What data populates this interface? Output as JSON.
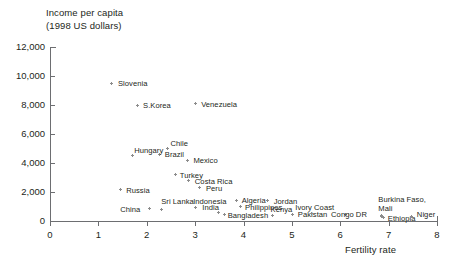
{
  "chart_data": {
    "type": "scatter",
    "title": "",
    "ylabel_line1": "Income per capita",
    "ylabel_line2": "(1998 US dollars)",
    "xlabel": "Fertility rate",
    "xlim": [
      0,
      8
    ],
    "ylim": [
      0,
      12000
    ],
    "xticks": [
      "0",
      "1",
      "2",
      "3",
      "4",
      "5",
      "6",
      "7",
      "8"
    ],
    "yticks": [
      "0",
      "2,000",
      "4,000",
      "6,000",
      "8,000",
      "10,000",
      "12,000"
    ],
    "grid": false,
    "legend": "none",
    "points": [
      {
        "label": "Slovenia",
        "x": 1.28,
        "y": 9500,
        "lx": 6,
        "ly": -4
      },
      {
        "label": "S.Korea",
        "x": 1.8,
        "y": 8000,
        "lx": 6,
        "ly": -4
      },
      {
        "label": "Venezuela",
        "x": 3.0,
        "y": 8100,
        "lx": 6,
        "ly": -4
      },
      {
        "label": "Chile",
        "x": 2.43,
        "y": 5000,
        "lx": 3,
        "ly": -10
      },
      {
        "label": "Brazil",
        "x": 2.27,
        "y": 4600,
        "lx": 5,
        "ly": -4
      },
      {
        "label": "Mexico",
        "x": 2.84,
        "y": 4200,
        "lx": 6,
        "ly": -4
      },
      {
        "label": "Hungary",
        "x": 1.7,
        "y": 4500,
        "lx": 2,
        "ly": -10
      },
      {
        "label": "Turkey",
        "x": 2.6,
        "y": 3200,
        "lx": 4,
        "ly": -4
      },
      {
        "label": "Costa Rica",
        "x": 2.87,
        "y": 2760,
        "lx": 6,
        "ly": -4
      },
      {
        "label": "Peru",
        "x": 3.1,
        "y": 2300,
        "lx": 6,
        "ly": -4
      },
      {
        "label": "Russia",
        "x": 1.45,
        "y": 2150,
        "lx": 6,
        "ly": -4
      },
      {
        "label": "Sri Lanka",
        "x": 2.3,
        "y": 820,
        "lx": 0,
        "ly": -12
      },
      {
        "label": "China",
        "x": 2.05,
        "y": 830,
        "lx": -29,
        "ly": -4
      },
      {
        "label": "Indonesia",
        "x": 3.0,
        "y": 900,
        "lx": -2,
        "ly": -11
      },
      {
        "label": "India",
        "x": 3.48,
        "y": 560,
        "lx": -16,
        "ly": -10
      },
      {
        "label": "Bangladesh",
        "x": 3.61,
        "y": 420,
        "lx": 3,
        "ly": -4
      },
      {
        "label": "Algeria",
        "x": 3.86,
        "y": 1420,
        "lx": 5,
        "ly": -4
      },
      {
        "label": "Philippines",
        "x": 3.93,
        "y": 1000,
        "lx": 5,
        "ly": -4
      },
      {
        "label": "Jordan",
        "x": 4.5,
        "y": 1400,
        "lx": 6,
        "ly": -4
      },
      {
        "label": "Kenya",
        "x": 4.6,
        "y": 380,
        "lx": -2,
        "ly": -10
      },
      {
        "label": "Pakistan",
        "x": 5.02,
        "y": 480,
        "lx": 5,
        "ly": -4
      },
      {
        "label": "Ivory Coast",
        "x": 5.4,
        "y": 500,
        "lx": -16,
        "ly": -11
      },
      {
        "label": "Congo DR",
        "x": 6.1,
        "y": 430,
        "lx": -14,
        "ly": -5
      },
      {
        "label": "Burkina Faso,",
        "x": 6.85,
        "y": 400,
        "lx": -3,
        "ly": -20
      },
      {
        "label": "Mali",
        "x": 6.85,
        "y": 320,
        "lx": -3,
        "ly": -12
      },
      {
        "label": "Ethiopia",
        "x": 6.9,
        "y": 230,
        "lx": 4,
        "ly": -4
      },
      {
        "label": "Niger",
        "x": 7.48,
        "y": 300,
        "lx": 5,
        "ly": -7
      }
    ]
  },
  "colors": {
    "axis": "#6d6e71",
    "text": "#231f20",
    "marker": "#8c8c8c",
    "background": "#ffffff"
  }
}
